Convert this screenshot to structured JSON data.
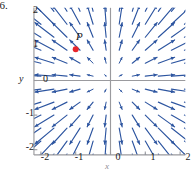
{
  "figure": {
    "problem_number": "36.",
    "x_axis_label": "x",
    "y_axis_label": "y",
    "point_label": "P"
  },
  "colors": {
    "arrow": "#2d55a0",
    "axis": "#9a9a9e",
    "frame": "#9a9a9e",
    "point": "#e8252a",
    "text": "#1a1a1a",
    "background": "#ffffff"
  },
  "ticks": {
    "x": [
      "-2",
      "-1",
      "0",
      "1",
      "2"
    ],
    "y": [
      "2",
      "1",
      "0",
      "-1",
      "-2"
    ]
  },
  "chart_data": {
    "type": "scatter",
    "title": "",
    "subtitle": "",
    "xlabel": "x",
    "ylabel": "y",
    "xlim": [
      -2.2,
      2.15
    ],
    "ylim": [
      -2.15,
      2.1
    ],
    "grid": false,
    "legend": null,
    "xticks": [
      -2,
      -1,
      0,
      1,
      2
    ],
    "yticks": [
      -2,
      -1,
      0,
      1,
      2
    ],
    "annotations": [
      {
        "label": "P",
        "x": -1.0,
        "y": 0.9,
        "marker": "filled-circle",
        "color": "#e8252a"
      }
    ],
    "vector_field": {
      "formula": "F(x,y) = k*(x, y)",
      "grid_x": [
        -2.0,
        -1.625,
        -1.25,
        -0.875,
        -0.5,
        -0.125,
        0.25,
        0.625,
        1.0,
        1.375,
        1.75,
        2.125
      ],
      "grid_y": [
        2.0,
        1.625,
        1.25,
        0.875,
        0.5,
        0.125,
        -0.25,
        -0.625,
        -1.0,
        -1.375,
        -1.75,
        -2.125
      ],
      "scale": 0.34,
      "arrow_color": "#2d55a0"
    }
  }
}
